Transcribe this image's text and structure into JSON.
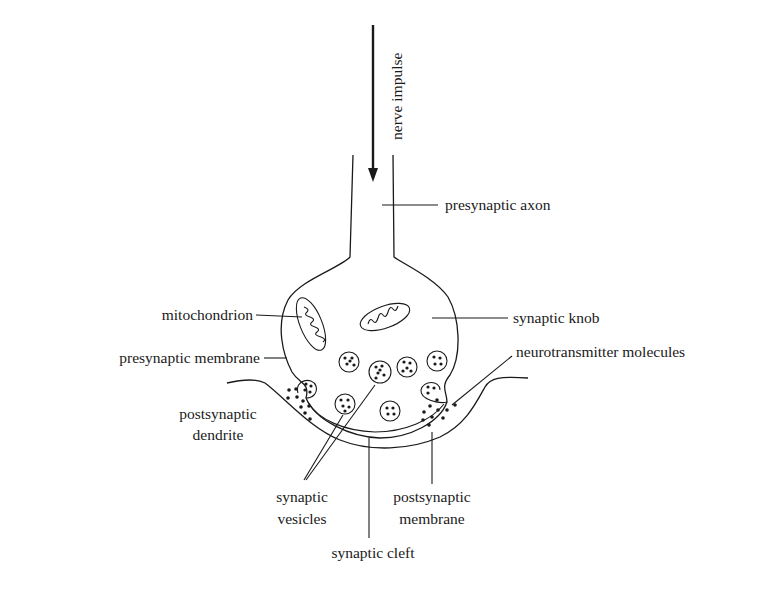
{
  "diagram": {
    "arrow": {
      "label": "nerve impulse",
      "direction": "down"
    },
    "labels": {
      "presynaptic_axon": "presynaptic axon",
      "mitochondrion": "mitochondrion",
      "synaptic_knob": "synaptic knob",
      "presynaptic_membrane": "presynaptic membrane",
      "neurotransmitter_molecules": "neurotransmitter molecules",
      "postsynaptic_dendrite_line1": "postsynaptic",
      "postsynaptic_dendrite_line2": "dendrite",
      "synaptic_vesicles_line1": "synaptic",
      "synaptic_vesicles_line2": "vesicles",
      "postsynaptic_membrane_line1": "postsynaptic",
      "postsynaptic_membrane_line2": "membrane",
      "synaptic_cleft": "synaptic cleft"
    },
    "colors": {
      "ink": "#1a1a1a",
      "background": "#ffffff"
    }
  }
}
